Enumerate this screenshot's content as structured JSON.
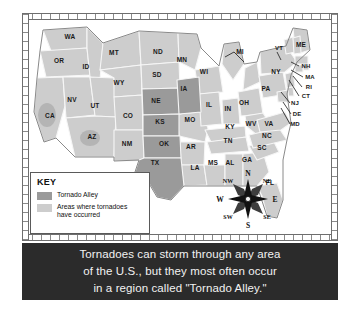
{
  "map": {
    "title": "United States Tornado Alley Map",
    "colors": {
      "tornado_alley": "#9a9a9a",
      "tornado_areas": "#cdcdcd",
      "state_border": "#f4f4f4",
      "outline": "#7a7a7a",
      "caption_bg": "#2b2b2b",
      "caption_text": "#f2f2f2"
    },
    "states": [
      {
        "abbr": "WA",
        "x": 41,
        "y": 17,
        "alley": false
      },
      {
        "abbr": "OR",
        "x": 30,
        "y": 41,
        "alley": false
      },
      {
        "abbr": "CA",
        "x": 21,
        "y": 96,
        "alley": false
      },
      {
        "abbr": "ID",
        "x": 57,
        "y": 47,
        "alley": false
      },
      {
        "abbr": "NV",
        "x": 43,
        "y": 80,
        "alley": false
      },
      {
        "abbr": "UT",
        "x": 66,
        "y": 86,
        "alley": false
      },
      {
        "abbr": "AZ",
        "x": 63,
        "y": 117,
        "alley": false
      },
      {
        "abbr": "MT",
        "x": 85,
        "y": 33,
        "alley": false
      },
      {
        "abbr": "WY",
        "x": 90,
        "y": 63,
        "alley": false
      },
      {
        "abbr": "CO",
        "x": 99,
        "y": 96,
        "alley": false
      },
      {
        "abbr": "NM",
        "x": 98,
        "y": 124,
        "alley": false
      },
      {
        "abbr": "ND",
        "x": 129,
        "y": 32,
        "alley": false
      },
      {
        "abbr": "SD",
        "x": 128,
        "y": 55,
        "alley": false
      },
      {
        "abbr": "NE",
        "x": 127,
        "y": 81,
        "alley": true
      },
      {
        "abbr": "KS",
        "x": 131,
        "y": 102,
        "alley": true
      },
      {
        "abbr": "OK",
        "x": 135,
        "y": 124,
        "alley": true
      },
      {
        "abbr": "TX",
        "x": 126,
        "y": 143,
        "alley": true
      },
      {
        "abbr": "MN",
        "x": 153,
        "y": 40,
        "alley": false
      },
      {
        "abbr": "IA",
        "x": 155,
        "y": 69,
        "alley": true
      },
      {
        "abbr": "MO",
        "x": 161,
        "y": 100,
        "alley": false
      },
      {
        "abbr": "AR",
        "x": 162,
        "y": 127,
        "alley": false
      },
      {
        "abbr": "LA",
        "x": 166,
        "y": 148,
        "alley": false
      },
      {
        "abbr": "WI",
        "x": 175,
        "y": 52,
        "alley": false
      },
      {
        "abbr": "IL",
        "x": 180,
        "y": 85,
        "alley": false
      },
      {
        "abbr": "MS",
        "x": 184,
        "y": 143,
        "alley": false
      },
      {
        "abbr": "MI",
        "x": 211,
        "y": 32,
        "alley": false
      },
      {
        "abbr": "IN",
        "x": 199,
        "y": 89,
        "alley": false
      },
      {
        "abbr": "KY",
        "x": 201,
        "y": 107,
        "alley": false
      },
      {
        "abbr": "TN",
        "x": 199,
        "y": 121,
        "alley": false
      },
      {
        "abbr": "AL",
        "x": 201,
        "y": 143,
        "alley": false
      },
      {
        "abbr": "OH",
        "x": 215,
        "y": 83,
        "alley": false
      },
      {
        "abbr": "WV",
        "x": 222,
        "y": 104,
        "alley": false
      },
      {
        "abbr": "GA",
        "x": 218,
        "y": 140,
        "alley": false
      },
      {
        "abbr": "FL",
        "x": 241,
        "y": 163,
        "alley": false
      },
      {
        "abbr": "SC",
        "x": 233,
        "y": 128,
        "alley": false
      },
      {
        "abbr": "NC",
        "x": 238,
        "y": 116,
        "alley": false
      },
      {
        "abbr": "VA",
        "x": 240,
        "y": 104,
        "alley": false
      },
      {
        "abbr": "PA",
        "x": 237,
        "y": 69,
        "alley": false
      },
      {
        "abbr": "NY",
        "x": 247,
        "y": 52,
        "alley": false
      },
      {
        "abbr": "VT",
        "x": 250,
        "y": 28,
        "alley": false
      },
      {
        "abbr": "ME",
        "x": 272,
        "y": 25,
        "alley": false
      },
      {
        "abbr": "NH",
        "x": 277,
        "y": 46,
        "alley": false
      },
      {
        "abbr": "MA",
        "x": 281,
        "y": 57,
        "alley": false
      },
      {
        "abbr": "RI",
        "x": 280,
        "y": 67,
        "alley": false
      },
      {
        "abbr": "CT",
        "x": 277,
        "y": 76,
        "alley": false
      },
      {
        "abbr": "NJ",
        "x": 266,
        "y": 83,
        "alley": false
      },
      {
        "abbr": "DE",
        "x": 268,
        "y": 94,
        "alley": false
      },
      {
        "abbr": "MD",
        "x": 266,
        "y": 104,
        "alley": false
      }
    ],
    "tornado_alley_states": [
      "NE",
      "IA",
      "KS",
      "OK",
      "TX"
    ]
  },
  "key": {
    "title": "KEY",
    "items": [
      {
        "label": "Tornado Alley",
        "color": "#9a9a9a"
      },
      {
        "label": "Areas where tornadoes\nhave occurred",
        "color": "#cdcdcd"
      }
    ]
  },
  "compass": {
    "directions": [
      {
        "label": "N",
        "x": 33,
        "y": 5,
        "cardinal": true
      },
      {
        "label": "NE",
        "x": 52,
        "y": 13,
        "cardinal": false
      },
      {
        "label": "E",
        "x": 60,
        "y": 31,
        "cardinal": true
      },
      {
        "label": "SE",
        "x": 52,
        "y": 49,
        "cardinal": false
      },
      {
        "label": "S",
        "x": 33,
        "y": 57,
        "cardinal": true
      },
      {
        "label": "SW",
        "x": 13,
        "y": 49,
        "cardinal": false
      },
      {
        "label": "W",
        "x": 5,
        "y": 31,
        "cardinal": true
      },
      {
        "label": "NW",
        "x": 13,
        "y": 13,
        "cardinal": false
      }
    ]
  },
  "caption": {
    "lines": [
      "Tornadoes can storm through any area",
      "of the U.S., but they most often occur",
      "in a region called \"Tornado Alley.\""
    ]
  }
}
